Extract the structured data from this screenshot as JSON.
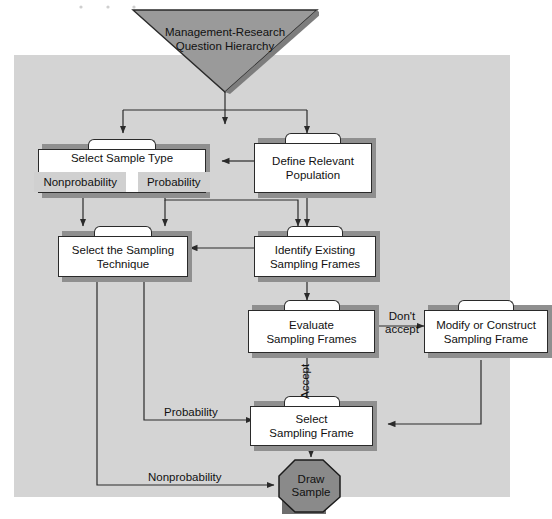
{
  "figure": {
    "type": "flowchart",
    "colors": {
      "panel_background": "#d4d4d4",
      "node_fill": "#ffffff",
      "node_border": "#2a2a2a",
      "shadow": "#8f8f8f",
      "triangle_fill": "#9a9a9a",
      "octagon_fill": "#8a8a8a",
      "chip_fill": "#d0d0d0",
      "line": "#2a2a2a"
    }
  },
  "start": {
    "shape": "inverted-triangle",
    "label": "Management-Research\nQuestion Hierarchy"
  },
  "nodes": [
    {
      "id": "select_sample_type",
      "label": "Select Sample Type",
      "chips": [
        "Nonprobability",
        "Probability"
      ]
    },
    {
      "id": "define_relevant_population",
      "label": "Define Relevant\nPopulation"
    },
    {
      "id": "select_sampling_technique",
      "label": "Select the Sampling\nTechnique"
    },
    {
      "id": "identify_existing_sampling_frames",
      "label": "Identify Existing\nSampling Frames"
    },
    {
      "id": "evaluate_sampling_frames",
      "label": "Evaluate\nSampling Frames"
    },
    {
      "id": "modify_or_construct_sampling_frame",
      "label": "Modify or Construct\nSampling Frame"
    },
    {
      "id": "select_sampling_frame",
      "label": "Select\nSampling Frame"
    }
  ],
  "end": {
    "shape": "octagon",
    "label": "Draw\nSample"
  },
  "edge_labels": {
    "dont_accept": "Don't\naccept",
    "accept": "Accept",
    "probability": "Probability",
    "nonprobability": "Nonprobability"
  }
}
